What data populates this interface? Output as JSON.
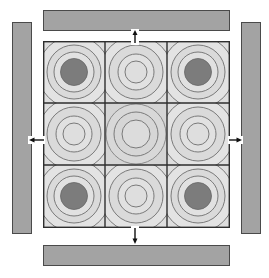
{
  "diagram": {
    "type": "3x3 concentric-ring grid with surrounding bars",
    "colors": {
      "bar_fill": "#a3a3a3",
      "bar_stroke": "#4a4a4a",
      "cell_fill": "#dedede",
      "center_cell_fill": "#d6d6d6",
      "ring_stroke": "#7a7a7a",
      "grid_line": "#2e2e2e",
      "dot_fill": "#7c7c7c",
      "arrow": "#111111"
    },
    "bars": [
      {
        "id": "top",
        "x": 43,
        "y": 10,
        "w": 187,
        "h": 21
      },
      {
        "id": "bottom",
        "x": 43,
        "y": 245,
        "w": 187,
        "h": 21
      },
      {
        "id": "left",
        "x": 12,
        "y": 22,
        "w": 20,
        "h": 212
      },
      {
        "id": "right",
        "x": 241,
        "y": 22,
        "w": 20,
        "h": 212
      }
    ],
    "cells": [
      {
        "row": 0,
        "col": 0,
        "kind": "dot"
      },
      {
        "row": 0,
        "col": 1,
        "kind": "rings"
      },
      {
        "row": 0,
        "col": 2,
        "kind": "dot"
      },
      {
        "row": 1,
        "col": 0,
        "kind": "rings"
      },
      {
        "row": 1,
        "col": 1,
        "kind": "center"
      },
      {
        "row": 1,
        "col": 2,
        "kind": "rings"
      },
      {
        "row": 2,
        "col": 0,
        "kind": "dot"
      },
      {
        "row": 2,
        "col": 1,
        "kind": "rings"
      },
      {
        "row": 2,
        "col": 2,
        "kind": "dot"
      }
    ],
    "arrows": [
      {
        "id": "up",
        "direction": "up"
      },
      {
        "id": "down",
        "direction": "down"
      },
      {
        "id": "left",
        "direction": "left"
      },
      {
        "id": "right",
        "direction": "right"
      }
    ]
  }
}
